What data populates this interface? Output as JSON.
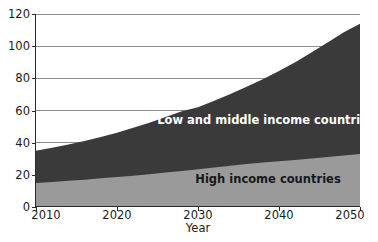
{
  "chart_data": {
    "type": "area",
    "stacked": true,
    "title": "",
    "subtitle": "",
    "xlabel": "Year",
    "ylabel": "",
    "x": [
      2010,
      2012,
      2014,
      2016,
      2018,
      2020,
      2022,
      2024,
      2026,
      2028,
      2030,
      2032,
      2034,
      2036,
      2038,
      2040,
      2042,
      2044,
      2046,
      2048,
      2050
    ],
    "xlim": [
      2010,
      2050
    ],
    "ylim": [
      0,
      120
    ],
    "xticks": [
      2010,
      2020,
      2030,
      2040,
      2050
    ],
    "xtick_labels": [
      "2010",
      "2020",
      "2030",
      "2040",
      "2050"
    ],
    "yticks": [
      0,
      20,
      40,
      60,
      80,
      100,
      120
    ],
    "ytick_labels": [
      "0",
      "20",
      "40",
      "60",
      "80",
      "100",
      "120"
    ],
    "grid": "horizontal",
    "legend_position": "inside-plot-area",
    "series": [
      {
        "name": "High income countries",
        "color": "#9a9a9a",
        "label_color": "#17181a",
        "values": [
          15.0,
          15.6,
          16.3,
          17.0,
          17.8,
          18.6,
          19.5,
          20.4,
          21.4,
          22.4,
          23.5,
          24.6,
          25.7,
          26.7,
          27.6,
          28.5,
          29.3,
          30.2,
          31.1,
          32.0,
          33.0
        ]
      },
      {
        "name": "Low and middle income countries",
        "color": "#3a3a3a",
        "label_color": "#ffffff",
        "values": [
          20.0,
          21.2,
          22.5,
          24.0,
          25.7,
          27.6,
          29.7,
          32.0,
          34.5,
          37.1,
          38.5,
          41.4,
          44.5,
          48.0,
          51.9,
          56.0,
          60.7,
          65.8,
          71.2,
          76.6,
          81.0
        ]
      }
    ],
    "totals": [
      35.0,
      36.8,
      38.8,
      41.0,
      43.5,
      46.2,
      49.2,
      52.4,
      55.9,
      59.5,
      62.0,
      66.0,
      70.2,
      74.7,
      79.5,
      84.5,
      90.0,
      96.0,
      102.3,
      108.6,
      114.0
    ],
    "annotations": [
      {
        "text": "Low and middle income countries",
        "x": 2036,
        "y": 48
      },
      {
        "text": "High income countries",
        "x": 2035,
        "y": 17
      }
    ]
  }
}
